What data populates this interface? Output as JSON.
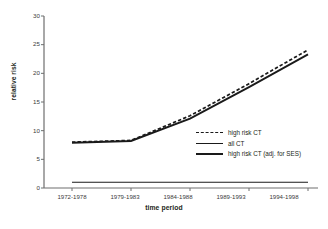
{
  "chart_data": {
    "type": "line",
    "title": "",
    "xlabel": "time period",
    "ylabel": "relative risk",
    "categories": [
      "1972-1978",
      "1979-1983",
      "1984-1988",
      "1989-1993",
      "1994-1998"
    ],
    "ylim": [
      0,
      30
    ],
    "yticks": [
      0,
      5,
      10,
      15,
      20,
      25,
      30
    ],
    "ytick_labels": [
      "0",
      "5",
      "10",
      "15",
      "20",
      "25",
      "30"
    ],
    "grid": false,
    "legend_position": "inside-lower-right",
    "series": [
      {
        "name": "high risk CT",
        "style": "dashed",
        "values": [
          8.0,
          8.3,
          12.6,
          18.2,
          24.1
        ]
      },
      {
        "name": "all CT",
        "style": "thin-solid",
        "values": [
          1.0,
          1.0,
          1.0,
          1.0,
          1.0
        ]
      },
      {
        "name": "high risk CT (adj. for SES)",
        "style": "thick-solid",
        "values": [
          7.9,
          8.2,
          12.1,
          17.6,
          23.3
        ]
      }
    ],
    "colors": {
      "line": "#1a1a1a",
      "axis": "#6e6e6e",
      "text": "#231f20",
      "background": "#ffffff"
    }
  },
  "legend": {
    "items": [
      {
        "label": "high risk CT"
      },
      {
        "label": "all CT"
      },
      {
        "label": "high risk CT (adj. for SES)"
      }
    ]
  }
}
